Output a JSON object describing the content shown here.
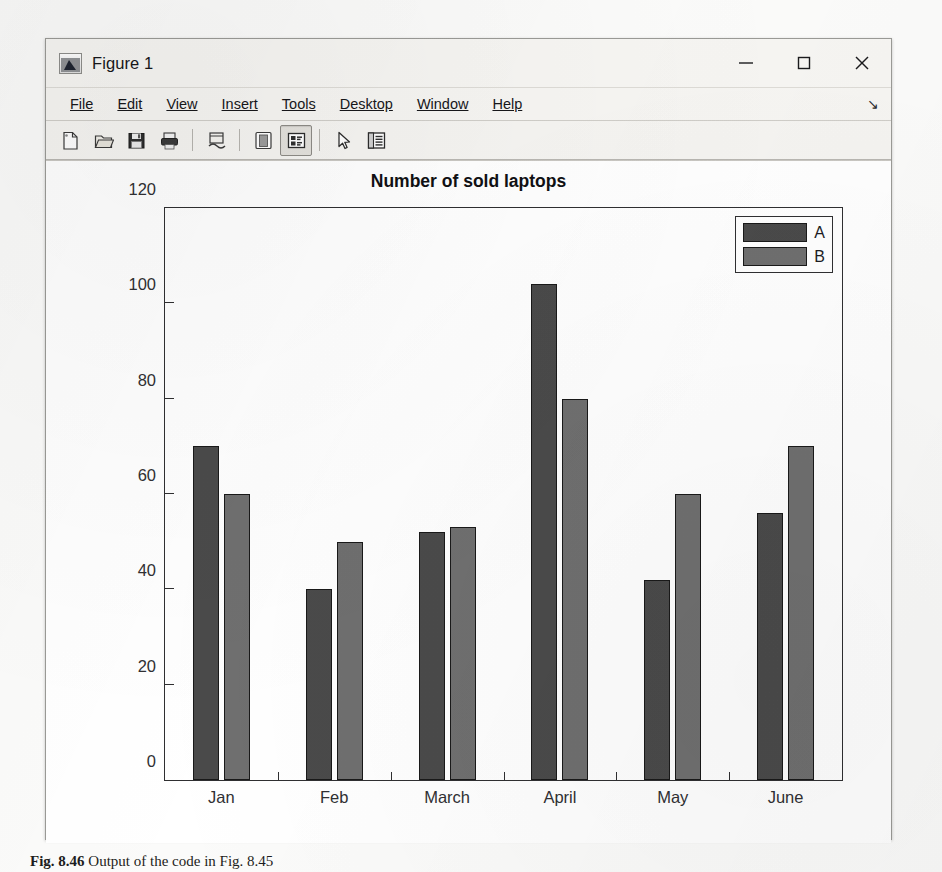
{
  "window": {
    "title": "Figure 1",
    "app_icon": "matlab-membrane-icon",
    "controls": {
      "minimize": "minimize-icon",
      "maximize": "maximize-icon",
      "close": "close-icon"
    }
  },
  "menu": {
    "items": [
      {
        "label": "File",
        "mnemonic": "F"
      },
      {
        "label": "Edit",
        "mnemonic": "E"
      },
      {
        "label": "View",
        "mnemonic": "V"
      },
      {
        "label": "Insert",
        "mnemonic": "I"
      },
      {
        "label": "Tools",
        "mnemonic": "T"
      },
      {
        "label": "Desktop",
        "mnemonic": "D"
      },
      {
        "label": "Window",
        "mnemonic": "W"
      },
      {
        "label": "Help",
        "mnemonic": "H"
      }
    ],
    "overflow_glyph": "↘"
  },
  "toolbar": {
    "buttons": [
      {
        "name": "new-figure-icon",
        "tooltip": "New Figure",
        "pressed": false
      },
      {
        "name": "open-file-icon",
        "tooltip": "Open File",
        "pressed": false
      },
      {
        "name": "save-figure-icon",
        "tooltip": "Save Figure",
        "pressed": false
      },
      {
        "name": "print-figure-icon",
        "tooltip": "Print Figure",
        "pressed": false
      },
      {
        "name": "link-plot-icon",
        "tooltip": "Link Plot",
        "pressed": false
      },
      {
        "name": "insert-colorbar-icon",
        "tooltip": "Insert Colorbar",
        "pressed": false
      },
      {
        "name": "insert-legend-icon",
        "tooltip": "Insert Legend",
        "pressed": true
      },
      {
        "name": "edit-plot-icon",
        "tooltip": "Edit Plot",
        "pressed": false
      },
      {
        "name": "show-plot-tools-icon",
        "tooltip": "Show Plot Tools",
        "pressed": false
      }
    ]
  },
  "chart_data": {
    "type": "bar",
    "title": "Number of sold laptops",
    "xlabel": "",
    "ylabel": "",
    "categories": [
      "Jan",
      "Feb",
      "March",
      "April",
      "May",
      "June"
    ],
    "series": [
      {
        "name": "A",
        "values": [
          70,
          40,
          52,
          104,
          42,
          56
        ],
        "color": "#4a4a4a"
      },
      {
        "name": "B",
        "values": [
          60,
          50,
          53,
          80,
          60,
          70
        ],
        "color": "#6f6f6f"
      }
    ],
    "ylim": [
      0,
      120
    ],
    "yticks": [
      0,
      20,
      40,
      60,
      80,
      100,
      120
    ],
    "ytick_labels": [
      "0",
      "20",
      "40",
      "60",
      "80",
      "100",
      "120"
    ],
    "grid": false,
    "legend_position": "top-right",
    "legend_entries": [
      "A",
      "B"
    ]
  },
  "caption": {
    "figure_number": "Fig. 8.46",
    "text": "Output of the code in Fig. 8.45"
  }
}
